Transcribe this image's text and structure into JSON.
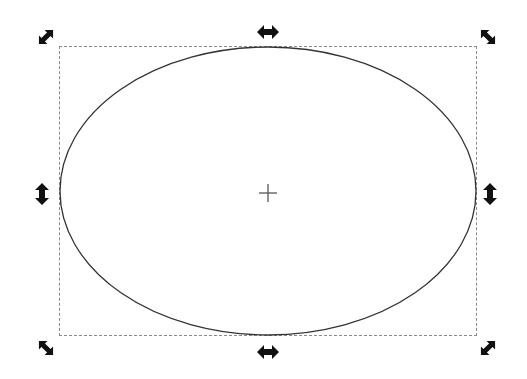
{
  "canvas": {
    "background": "#ffffff",
    "selection": {
      "tool": "selector",
      "mode": "scale",
      "bbox": {
        "x": 59,
        "y": 46,
        "width": 418,
        "height": 290
      },
      "bbox_style": "dashed",
      "bbox_color": "#8a8a8a"
    },
    "object": {
      "type": "ellipse",
      "cx": 268,
      "cy": 191,
      "rx": 208,
      "ry": 144,
      "stroke": "#333333",
      "fill": "none"
    },
    "center_marker": {
      "icon": "crosshair-icon",
      "x": 268,
      "y": 193
    },
    "handles": [
      {
        "name": "handle-top-left",
        "icon": "diagonal-resize-arrow-icon",
        "x": 46,
        "y": 37
      },
      {
        "name": "handle-top-center",
        "icon": "horizontal-resize-arrow-icon",
        "x": 268,
        "y": 32
      },
      {
        "name": "handle-top-right",
        "icon": "diagonal-resize-arrow-icon",
        "x": 488,
        "y": 37
      },
      {
        "name": "handle-middle-left",
        "icon": "vertical-resize-arrow-icon",
        "x": 42,
        "y": 194
      },
      {
        "name": "handle-middle-right",
        "icon": "vertical-resize-arrow-icon",
        "x": 490,
        "y": 194
      },
      {
        "name": "handle-bottom-left",
        "icon": "diagonal-resize-arrow-icon",
        "x": 46,
        "y": 348
      },
      {
        "name": "handle-bottom-center",
        "icon": "horizontal-resize-arrow-icon",
        "x": 268,
        "y": 352
      },
      {
        "name": "handle-bottom-right",
        "icon": "diagonal-resize-arrow-icon",
        "x": 488,
        "y": 348
      }
    ],
    "handle_color": "#111111"
  }
}
